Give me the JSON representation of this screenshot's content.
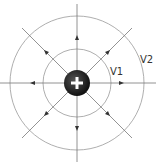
{
  "diagram": {
    "charge": {
      "sign": "+",
      "color": "#222222"
    },
    "labels": {
      "v1": "V1",
      "v2": "V2"
    },
    "colors": {
      "line": "#777777",
      "circle": "#999999"
    }
  }
}
